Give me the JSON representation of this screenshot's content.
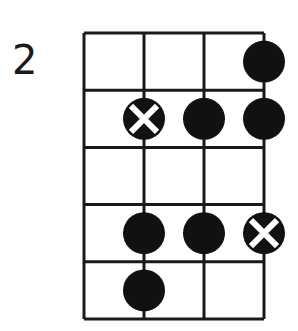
{
  "diagram": {
    "label": "2",
    "type": "fretboard-scale-diagram",
    "strings": 4,
    "frets": 5,
    "grid": {
      "x0": 84,
      "y0": 33,
      "string_spacing": 60,
      "fret_spacing": 57.2
    },
    "colors": {
      "line": "#1a1a1a",
      "dot": "#111111",
      "x_mark": "#ffffff",
      "background": "#ffffff"
    },
    "markers": [
      {
        "fret": 1,
        "string": 4,
        "kind": "dot"
      },
      {
        "fret": 2,
        "string": 2,
        "kind": "root-x"
      },
      {
        "fret": 2,
        "string": 3,
        "kind": "dot"
      },
      {
        "fret": 2,
        "string": 4,
        "kind": "dot"
      },
      {
        "fret": 4,
        "string": 2,
        "kind": "dot"
      },
      {
        "fret": 4,
        "string": 3,
        "kind": "dot"
      },
      {
        "fret": 4,
        "string": 4,
        "kind": "root-x"
      },
      {
        "fret": 5,
        "string": 2,
        "kind": "dot"
      }
    ]
  }
}
